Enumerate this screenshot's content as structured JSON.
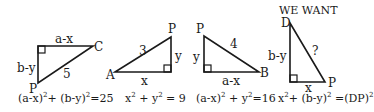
{
  "title": "WE WANT",
  "stroke_color": "#1a1a1a",
  "triangles": [
    {
      "id": "t1",
      "vertices": {
        "top": [
          38,
          46
        ],
        "right": [
          93,
          46
        ],
        "bottom": [
          38,
          83
        ]
      },
      "labels": {
        "top_side": "a-x",
        "left_side": "b-y",
        "hypotenuse": "5",
        "vertex_right": "C",
        "vertex_bottom": "P"
      },
      "equation": {
        "base1": "(a-x)",
        "sup1": "2",
        "mid": "+ (b-y)",
        "sup2": "2",
        "end": "=25"
      }
    },
    {
      "id": "t2",
      "vertices": {
        "left": [
          115,
          72
        ],
        "corner": [
          171,
          72
        ],
        "top": [
          171,
          37
        ]
      },
      "labels": {
        "bottom_side": "x",
        "right_side": "y",
        "hypotenuse": "3",
        "vertex_left": "A",
        "vertex_top": "P"
      },
      "equation": {
        "base1": "x",
        "sup1": "2",
        "mid": " + y",
        "sup2": "2",
        "end": " = 9"
      }
    },
    {
      "id": "t3",
      "vertices": {
        "top": [
          204,
          36
        ],
        "corner": [
          204,
          72
        ],
        "right": [
          259,
          72
        ]
      },
      "labels": {
        "left_side": "y",
        "bottom_side": "a-x",
        "hypotenuse": "4",
        "vertex_top": "P",
        "vertex_right": "B"
      },
      "equation": {
        "base1": "(a-x)",
        "sup1": "2",
        "mid": " + y",
        "sup2": "2",
        "end": "=16"
      }
    },
    {
      "id": "t4",
      "vertices": {
        "top": [
          290,
          23
        ],
        "corner": [
          290,
          82
        ],
        "right": [
          325,
          82
        ]
      },
      "labels": {
        "left_side": "b-y",
        "bottom_side": "x",
        "hypotenuse": "?",
        "vertex_top": "D",
        "vertex_right": "P"
      },
      "equation": {
        "base1": "x",
        "sup1": "2",
        "mid": "+ (b-y)",
        "sup2": "2",
        "end": " =(DP)",
        "sup3": "2"
      }
    }
  ]
}
